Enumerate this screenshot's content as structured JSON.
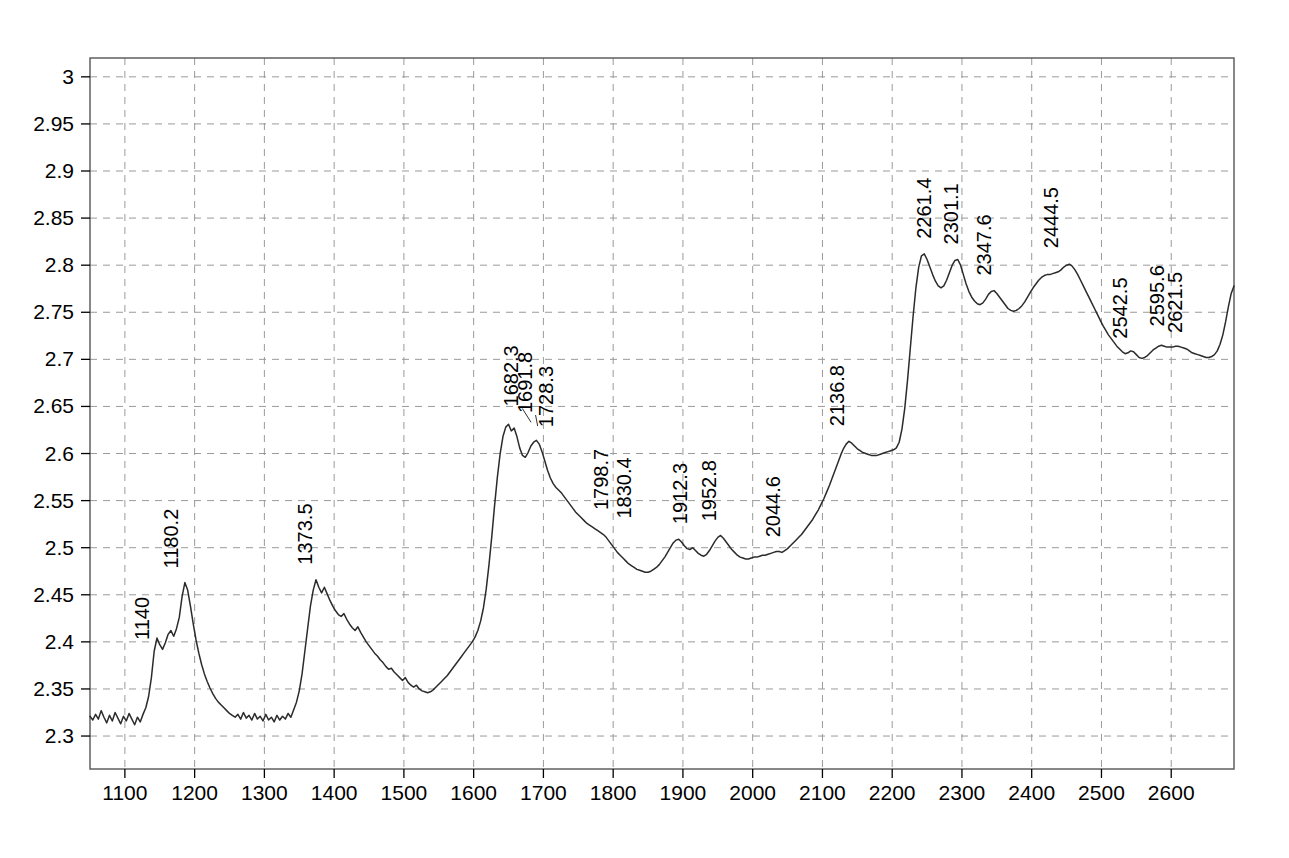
{
  "chart_data": {
    "type": "line",
    "title": "",
    "subtitle": "",
    "xlabel": "",
    "ylabel": "",
    "xlim": [
      1050,
      2690
    ],
    "ylim": [
      2.265,
      3.02
    ],
    "grid": true,
    "legend": null,
    "legend_position": "none",
    "line_color": "#2b2b2b",
    "grid_color": "#9a9a9a",
    "axis_color": "#555555",
    "background_color": "#ffffff",
    "xticks": [
      1100,
      1200,
      1300,
      1400,
      1500,
      1600,
      1700,
      1800,
      1900,
      2000,
      2100,
      2200,
      2300,
      2400,
      2500,
      2600
    ],
    "xtick_labels": [
      "1100",
      "1200",
      "1300",
      "1400",
      "1500",
      "1600",
      "1700",
      "1800",
      "1900",
      "2000",
      "2100",
      "2200",
      "2300",
      "2400",
      "2500",
      "2600"
    ],
    "yticks": [
      2.3,
      2.35,
      2.4,
      2.45,
      2.5,
      2.55,
      2.6,
      2.65,
      2.7,
      2.75,
      2.8,
      2.85,
      2.9,
      2.95,
      3
    ],
    "ytick_labels": [
      "2.3",
      "2.35",
      "2.4",
      "2.45",
      "2.5",
      "2.55",
      "2.6",
      "2.65",
      "2.7",
      "2.75",
      "2.8",
      "2.85",
      "2.9",
      "2.95",
      "3"
    ],
    "annotations": [
      {
        "label": "1140",
        "x": 1140.0,
        "y": 2.404,
        "label_x": 1134,
        "label_y": 2.402,
        "leader": false
      },
      {
        "label": "1180.2",
        "x": 1180.2,
        "y": 2.463,
        "label_x": 1176,
        "label_y": 2.478,
        "leader": false
      },
      {
        "label": "1373.5",
        "x": 1373.5,
        "y": 2.466,
        "label_x": 1368,
        "label_y": 2.482,
        "leader": false
      },
      {
        "label": "1682.3",
        "x": 1682.3,
        "y": 2.631,
        "label_x": 1664,
        "label_y": 2.65,
        "leader": true
      },
      {
        "label": "1691.8",
        "x": 1691.8,
        "y": 2.627,
        "label_x": 1683,
        "label_y": 2.643,
        "leader": true
      },
      {
        "label": "1728.3",
        "x": 1728.3,
        "y": 2.614,
        "label_x": 1714,
        "label_y": 2.628,
        "leader": false
      },
      {
        "label": "1798.7",
        "x": 1798.7,
        "y": 2.524,
        "label_x": 1793,
        "label_y": 2.54,
        "leader": false
      },
      {
        "label": "1830.4",
        "x": 1830.4,
        "y": 2.516,
        "label_x": 1825,
        "label_y": 2.531,
        "leader": false
      },
      {
        "label": "1912.3",
        "x": 1912.3,
        "y": 2.509,
        "label_x": 1906,
        "label_y": 2.525,
        "leader": false
      },
      {
        "label": "1952.8",
        "x": 1952.8,
        "y": 2.513,
        "label_x": 1947,
        "label_y": 2.528,
        "leader": false
      },
      {
        "label": "2044.6",
        "x": 2044.6,
        "y": 2.496,
        "label_x": 2039,
        "label_y": 2.511,
        "leader": false
      },
      {
        "label": "2136.8",
        "x": 2136.8,
        "y": 2.613,
        "label_x": 2131,
        "label_y": 2.629,
        "leader": false
      },
      {
        "label": "2261.4",
        "x": 2261.4,
        "y": 2.812,
        "label_x": 2256,
        "label_y": 2.828,
        "leader": false
      },
      {
        "label": "2301.1",
        "x": 2301.1,
        "y": 2.806,
        "label_x": 2295,
        "label_y": 2.822,
        "leader": false
      },
      {
        "label": "2347.6",
        "x": 2347.6,
        "y": 2.773,
        "label_x": 2342,
        "label_y": 2.789,
        "leader": false
      },
      {
        "label": "2444.5",
        "x": 2444.5,
        "y": 2.801,
        "label_x": 2438,
        "label_y": 2.818,
        "leader": false
      },
      {
        "label": "2542.5",
        "x": 2542.5,
        "y": 2.706,
        "label_x": 2536,
        "label_y": 2.722,
        "leader": false
      },
      {
        "label": "2595.6",
        "x": 2595.6,
        "y": 2.715,
        "label_x": 2590,
        "label_y": 2.735,
        "leader": false
      },
      {
        "label": "2621.5",
        "x": 2621.5,
        "y": 2.712,
        "label_x": 2615,
        "label_y": 2.728,
        "leader": false
      }
    ],
    "x": [
      1050,
      1054,
      1058,
      1062,
      1066,
      1070,
      1074,
      1078,
      1082,
      1086,
      1090,
      1094,
      1098,
      1102,
      1106,
      1110,
      1114,
      1118,
      1122,
      1126,
      1130,
      1134,
      1138,
      1142,
      1146,
      1150,
      1154,
      1158,
      1162,
      1166,
      1170,
      1174,
      1178,
      1182,
      1186,
      1190,
      1194,
      1198,
      1202,
      1206,
      1210,
      1214,
      1218,
      1222,
      1226,
      1230,
      1234,
      1238,
      1242,
      1246,
      1250,
      1254,
      1258,
      1262,
      1266,
      1270,
      1274,
      1278,
      1282,
      1286,
      1290,
      1294,
      1298,
      1302,
      1306,
      1310,
      1314,
      1318,
      1322,
      1326,
      1330,
      1334,
      1338,
      1342,
      1346,
      1350,
      1354,
      1358,
      1362,
      1366,
      1370,
      1374,
      1378,
      1382,
      1386,
      1390,
      1394,
      1398,
      1402,
      1406,
      1410,
      1414,
      1418,
      1422,
      1426,
      1430,
      1434,
      1438,
      1442,
      1446,
      1450,
      1454,
      1458,
      1462,
      1466,
      1470,
      1474,
      1478,
      1482,
      1486,
      1490,
      1494,
      1498,
      1502,
      1506,
      1510,
      1514,
      1518,
      1522,
      1526,
      1530,
      1534,
      1538,
      1542,
      1546,
      1550,
      1554,
      1558,
      1562,
      1566,
      1570,
      1574,
      1578,
      1582,
      1586,
      1590,
      1594,
      1598,
      1602,
      1606,
      1610,
      1614,
      1618,
      1622,
      1626,
      1630,
      1634,
      1638,
      1642,
      1646,
      1650,
      1654,
      1658,
      1662,
      1666,
      1670,
      1674,
      1678,
      1682,
      1686,
      1690,
      1694,
      1698,
      1702,
      1706,
      1710,
      1714,
      1718,
      1722,
      1726,
      1730,
      1734,
      1738,
      1742,
      1746,
      1750,
      1754,
      1758,
      1762,
      1766,
      1770,
      1774,
      1778,
      1782,
      1786,
      1790,
      1794,
      1798,
      1802,
      1806,
      1810,
      1814,
      1818,
      1822,
      1826,
      1830,
      1834,
      1838,
      1842,
      1846,
      1850,
      1854,
      1858,
      1862,
      1866,
      1870,
      1874,
      1878,
      1882,
      1886,
      1890,
      1894,
      1898,
      1902,
      1906,
      1910,
      1914,
      1918,
      1922,
      1926,
      1930,
      1934,
      1938,
      1942,
      1946,
      1950,
      1954,
      1958,
      1962,
      1966,
      1970,
      1974,
      1978,
      1982,
      1986,
      1990,
      1994,
      1998,
      2002,
      2006,
      2010,
      2014,
      2018,
      2022,
      2026,
      2030,
      2034,
      2038,
      2042,
      2046,
      2050,
      2054,
      2058,
      2062,
      2066,
      2070,
      2074,
      2078,
      2082,
      2086,
      2090,
      2094,
      2098,
      2102,
      2106,
      2110,
      2114,
      2118,
      2122,
      2126,
      2130,
      2134,
      2138,
      2142,
      2146,
      2150,
      2154,
      2158,
      2162,
      2166,
      2170,
      2174,
      2178,
      2182,
      2186,
      2190,
      2194,
      2198,
      2202,
      2206,
      2210,
      2214,
      2218,
      2222,
      2226,
      2230,
      2234,
      2238,
      2242,
      2246,
      2250,
      2254,
      2258,
      2262,
      2266,
      2270,
      2274,
      2278,
      2282,
      2286,
      2290,
      2294,
      2298,
      2302,
      2306,
      2310,
      2314,
      2318,
      2322,
      2326,
      2330,
      2334,
      2338,
      2342,
      2346,
      2350,
      2354,
      2358,
      2362,
      2366,
      2370,
      2374,
      2378,
      2382,
      2386,
      2390,
      2394,
      2398,
      2402,
      2406,
      2410,
      2414,
      2418,
      2422,
      2426,
      2430,
      2434,
      2438,
      2442,
      2446,
      2450,
      2454,
      2458,
      2462,
      2466,
      2470,
      2474,
      2478,
      2482,
      2486,
      2490,
      2494,
      2498,
      2502,
      2506,
      2510,
      2514,
      2518,
      2522,
      2526,
      2530,
      2534,
      2538,
      2542,
      2546,
      2550,
      2554,
      2558,
      2562,
      2566,
      2570,
      2574,
      2578,
      2582,
      2586,
      2590,
      2594,
      2598,
      2602,
      2606,
      2610,
      2614,
      2618,
      2622,
      2626,
      2630,
      2634,
      2638,
      2642,
      2646,
      2650,
      2654,
      2658,
      2662,
      2666,
      2670,
      2674,
      2678,
      2682,
      2686,
      2690
    ],
    "y": [
      2.321,
      2.317,
      2.323,
      2.318,
      2.327,
      2.32,
      2.314,
      2.322,
      2.316,
      2.325,
      2.319,
      2.313,
      2.321,
      2.316,
      2.324,
      2.318,
      2.312,
      2.32,
      2.315,
      2.323,
      2.33,
      2.342,
      2.362,
      2.39,
      2.404,
      2.397,
      2.392,
      2.399,
      2.408,
      2.412,
      2.406,
      2.414,
      2.426,
      2.448,
      2.463,
      2.455,
      2.438,
      2.419,
      2.402,
      2.388,
      2.376,
      2.366,
      2.358,
      2.351,
      2.345,
      2.34,
      2.336,
      2.333,
      2.33,
      2.327,
      2.324,
      2.322,
      2.32,
      2.323,
      2.318,
      2.325,
      2.319,
      2.322,
      2.317,
      2.324,
      2.318,
      2.321,
      2.316,
      2.323,
      2.317,
      2.32,
      2.315,
      2.322,
      2.317,
      2.321,
      2.318,
      2.324,
      2.32,
      2.328,
      2.336,
      2.348,
      2.366,
      2.39,
      2.414,
      2.438,
      2.455,
      2.466,
      2.458,
      2.452,
      2.458,
      2.451,
      2.444,
      2.438,
      2.433,
      2.429,
      2.427,
      2.43,
      2.424,
      2.419,
      2.415,
      2.412,
      2.416,
      2.41,
      2.405,
      2.4,
      2.396,
      2.392,
      2.388,
      2.385,
      2.381,
      2.378,
      2.374,
      2.371,
      2.372,
      2.368,
      2.365,
      2.362,
      2.359,
      2.362,
      2.357,
      2.354,
      2.352,
      2.354,
      2.35,
      2.348,
      2.347,
      2.346,
      2.347,
      2.349,
      2.352,
      2.355,
      2.358,
      2.361,
      2.364,
      2.368,
      2.372,
      2.376,
      2.38,
      2.384,
      2.388,
      2.392,
      2.396,
      2.4,
      2.405,
      2.412,
      2.422,
      2.436,
      2.456,
      2.482,
      2.512,
      2.545,
      2.575,
      2.6,
      2.618,
      2.628,
      2.631,
      2.624,
      2.627,
      2.618,
      2.606,
      2.598,
      2.596,
      2.601,
      2.608,
      2.612,
      2.614,
      2.61,
      2.602,
      2.592,
      2.582,
      2.574,
      2.568,
      2.564,
      2.561,
      2.558,
      2.554,
      2.55,
      2.546,
      2.542,
      2.538,
      2.535,
      2.532,
      2.529,
      2.526,
      2.524,
      2.522,
      2.52,
      2.518,
      2.516,
      2.514,
      2.511,
      2.507,
      2.503,
      2.499,
      2.495,
      2.492,
      2.489,
      2.486,
      2.483,
      2.481,
      2.479,
      2.477,
      2.476,
      2.475,
      2.474,
      2.474,
      2.475,
      2.477,
      2.479,
      2.482,
      2.486,
      2.49,
      2.495,
      2.5,
      2.505,
      2.508,
      2.509,
      2.506,
      2.502,
      2.499,
      2.498,
      2.5,
      2.497,
      2.494,
      2.492,
      2.491,
      2.493,
      2.497,
      2.502,
      2.507,
      2.511,
      2.513,
      2.51,
      2.506,
      2.502,
      2.498,
      2.495,
      2.492,
      2.49,
      2.489,
      2.488,
      2.488,
      2.489,
      2.49,
      2.49,
      2.491,
      2.492,
      2.492,
      2.493,
      2.494,
      2.495,
      2.496,
      2.496,
      2.495,
      2.497,
      2.499,
      2.502,
      2.505,
      2.508,
      2.511,
      2.514,
      2.518,
      2.522,
      2.526,
      2.53,
      2.535,
      2.54,
      2.546,
      2.552,
      2.559,
      2.566,
      2.574,
      2.582,
      2.59,
      2.598,
      2.605,
      2.61,
      2.613,
      2.611,
      2.608,
      2.605,
      2.603,
      2.601,
      2.6,
      2.599,
      2.598,
      2.598,
      2.598,
      2.599,
      2.6,
      2.601,
      2.602,
      2.603,
      2.604,
      2.606,
      2.612,
      2.626,
      2.648,
      2.678,
      2.712,
      2.746,
      2.776,
      2.798,
      2.81,
      2.812,
      2.806,
      2.798,
      2.79,
      2.783,
      2.778,
      2.776,
      2.778,
      2.784,
      2.792,
      2.8,
      2.805,
      2.806,
      2.8,
      2.79,
      2.78,
      2.772,
      2.766,
      2.762,
      2.759,
      2.758,
      2.76,
      2.764,
      2.769,
      2.772,
      2.773,
      2.77,
      2.766,
      2.762,
      2.758,
      2.754,
      2.752,
      2.751,
      2.752,
      2.754,
      2.757,
      2.761,
      2.766,
      2.771,
      2.776,
      2.78,
      2.784,
      2.787,
      2.789,
      2.79,
      2.79,
      2.791,
      2.792,
      2.793,
      2.795,
      2.798,
      2.8,
      2.801,
      2.799,
      2.795,
      2.79,
      2.784,
      2.778,
      2.772,
      2.766,
      2.76,
      2.754,
      2.748,
      2.742,
      2.736,
      2.731,
      2.726,
      2.722,
      2.718,
      2.714,
      2.711,
      2.708,
      2.706,
      2.707,
      2.709,
      2.708,
      2.705,
      2.702,
      2.701,
      2.702,
      2.704,
      2.707,
      2.71,
      2.712,
      2.714,
      2.715,
      2.714,
      2.713,
      2.713,
      2.713,
      2.714,
      2.714,
      2.713,
      2.712,
      2.711,
      2.709,
      2.707,
      2.706,
      2.705,
      2.704,
      2.703,
      2.702,
      2.702,
      2.703,
      2.705,
      2.709,
      2.716,
      2.726,
      2.74,
      2.756,
      2.77,
      2.778
    ]
  }
}
